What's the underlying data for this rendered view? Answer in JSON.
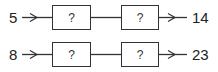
{
  "diagram": {
    "type": "function-machine",
    "rows": [
      {
        "input": "5",
        "boxes": [
          "?",
          "?"
        ],
        "output": "14"
      },
      {
        "input": "8",
        "boxes": [
          "?",
          "?"
        ],
        "output": "23"
      }
    ]
  },
  "colors": {
    "stroke": "#333333",
    "text": "#222222",
    "background": "#ffffff"
  }
}
